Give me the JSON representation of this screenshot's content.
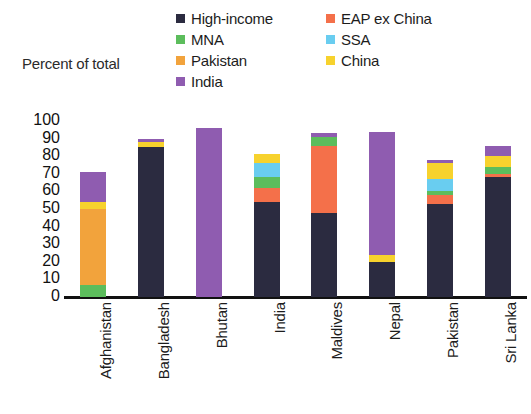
{
  "axis_title": "Percent of total",
  "legend": [
    {
      "label": "High-income",
      "color": "#2b2b40"
    },
    {
      "label": "EAP ex China",
      "color": "#f4704a"
    },
    {
      "label": "MNA",
      "color": "#5cbd5c"
    },
    {
      "label": "SSA",
      "color": "#69cdf0"
    },
    {
      "label": "Pakistan",
      "color": "#f2a33c"
    },
    {
      "label": "China",
      "color": "#f7d22d"
    },
    {
      "label": "India",
      "color": "#8f5cb0"
    }
  ],
  "chart_data": {
    "type": "bar",
    "title": "",
    "subtitle": "",
    "xlabel": "",
    "ylabel": "Percent of total",
    "ylim": [
      0,
      100
    ],
    "yticks": [
      0,
      10,
      20,
      30,
      40,
      50,
      60,
      70,
      80,
      90,
      100
    ],
    "grid": false,
    "stacked": true,
    "legend_position": "top",
    "categories": [
      "Afghanistan",
      "Bangladesh",
      "Bhutan",
      "India",
      "Maldives",
      "Nepal",
      "Pakistan",
      "Sri Lanka"
    ],
    "series": [
      {
        "name": "High-income",
        "color": "#2b2b40",
        "values": [
          0,
          85,
          0,
          54,
          48,
          20,
          53,
          68
        ]
      },
      {
        "name": "EAP ex China",
        "color": "#f4704a",
        "values": [
          0,
          0,
          0,
          8,
          38,
          0,
          5,
          2
        ]
      },
      {
        "name": "MNA",
        "color": "#5cbd5c",
        "values": [
          7,
          0,
          0,
          6,
          5,
          0,
          2,
          4
        ]
      },
      {
        "name": "SSA",
        "color": "#69cdf0",
        "values": [
          0,
          0,
          0,
          8,
          0,
          0,
          7,
          0
        ]
      },
      {
        "name": "Pakistan",
        "color": "#f2a33c",
        "values": [
          43,
          0,
          0,
          0,
          0,
          0,
          0,
          0
        ]
      },
      {
        "name": "China",
        "color": "#f7d22d",
        "values": [
          4,
          3,
          0,
          5,
          0,
          4,
          9,
          6
        ]
      },
      {
        "name": "India",
        "color": "#8f5cb0",
        "values": [
          17,
          2,
          96,
          0,
          2,
          70,
          2,
          6
        ]
      }
    ],
    "totals": [
      71,
      90,
      96,
      81,
      93,
      94,
      78,
      86
    ]
  }
}
